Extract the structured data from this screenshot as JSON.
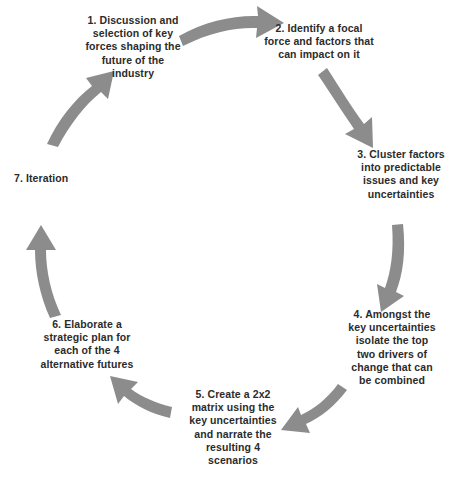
{
  "diagram": {
    "type": "cycle",
    "title": "",
    "arrow_color": "#8c8c8c",
    "text_color": "#2b2b2b",
    "background_color": "#ffffff",
    "steps": [
      {
        "number": "1",
        "text": "1. Discussion and\nselection of key\nforces shaping the\nfuture of the\nindustry"
      },
      {
        "number": "2",
        "text": "2. Identify a focal\nforce and factors that\ncan impact on it"
      },
      {
        "number": "3",
        "text": "3. Cluster factors\ninto predictable\nissues and key\nuncertainties"
      },
      {
        "number": "4",
        "text": "4. Amongst the\nkey uncertainties\nisolate the top\ntwo drivers of\nchange that can\nbe combined"
      },
      {
        "number": "5",
        "text": "5. Create a 2x2\nmatrix using the\nkey uncertainties\nand narrate the\nresulting 4\nscenarios"
      },
      {
        "number": "6",
        "text": "6. Elaborate a\nstrategic plan for\neach of the 4\nalternative futures"
      },
      {
        "number": "7",
        "text": "7. Iteration"
      }
    ],
    "connectors": [
      {
        "from": "1",
        "to": "2",
        "direction": "right"
      },
      {
        "from": "2",
        "to": "3",
        "direction": "down-right"
      },
      {
        "from": "3",
        "to": "4",
        "direction": "down"
      },
      {
        "from": "4",
        "to": "5",
        "direction": "down-left"
      },
      {
        "from": "5",
        "to": "6",
        "direction": "up-left"
      },
      {
        "from": "6",
        "to": "7",
        "direction": "up"
      },
      {
        "from": "7",
        "to": "1",
        "direction": "up-right"
      }
    ]
  }
}
